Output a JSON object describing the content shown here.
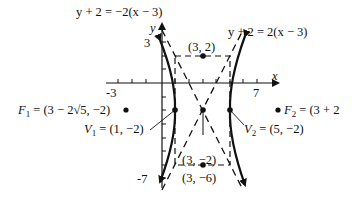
{
  "diagram": {
    "type": "hyperbola",
    "equation_hint": "(x-3)^2/4 - (y+2)^2/16 = 1",
    "axes": {
      "x_label": "x",
      "y_label": "y",
      "x_tick_labels": [
        "-3",
        "7"
      ],
      "y_tick_labels": [
        "3",
        "-7"
      ]
    },
    "asymptotes": [
      {
        "label": "y + 2 = −2(x − 3)"
      },
      {
        "label": "y + 2 = 2(x − 3)"
      }
    ],
    "points": {
      "center": {
        "label": "(3, −2)",
        "x": 3,
        "y": -2
      },
      "top_rect": {
        "label": "(3, 2)",
        "x": 3,
        "y": 2
      },
      "bottom_rect": {
        "label": "(3, −6)",
        "x": 3,
        "y": -6
      },
      "v1": {
        "name": "V",
        "sub": "1",
        "value": " = (1, −2)",
        "x": 1,
        "y": -2
      },
      "v2": {
        "name": "V",
        "sub": "2",
        "value": " = (5, −2)",
        "x": 5,
        "y": -2
      },
      "f1": {
        "name": "F",
        "sub": "1",
        "value": " = (3 − 2√5, −2)"
      },
      "f2": {
        "name": "F",
        "sub": "2",
        "value": " = (3 + 2"
      }
    }
  }
}
